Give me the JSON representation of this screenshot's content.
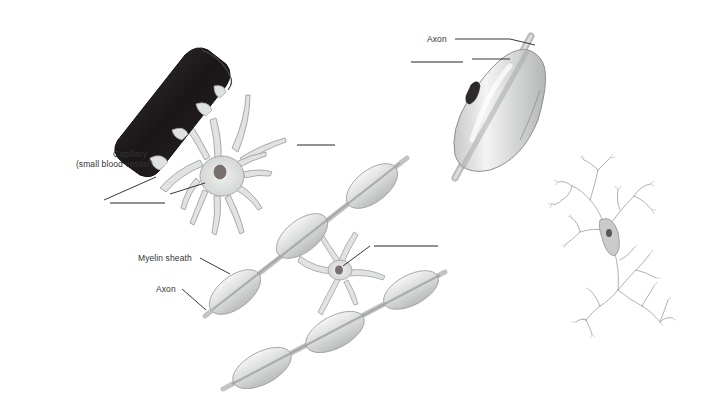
{
  "diagram": {
    "type": "anatomical-illustration",
    "background_color": "#ffffff",
    "figures": [
      {
        "id": "astrocyte",
        "description": "Star-shaped cell with processes attached to a dark capillary",
        "blank_label_count": 2
      },
      {
        "id": "schwann-cell",
        "description": "Cell wrapping around an axon forming myelin",
        "blank_label_count": 1
      },
      {
        "id": "oligodendrocyte",
        "description": "Cell with processes forming myelin sheaths on multiple axons",
        "blank_label_count": 2
      },
      {
        "id": "microglia",
        "description": "Small branching cell with spindle body",
        "blank_label_count": 0
      }
    ],
    "colors": {
      "capillary": "#1e1a1c",
      "cell_fill": "#e4e6e4",
      "cell_stroke": "#9a9e9c",
      "axon": "#c9cbca",
      "nucleus": "#6b5f5f",
      "line": "#222222"
    }
  },
  "labels": {
    "capillary_line1": "Capillary",
    "capillary_line2": "(small blood vessel)",
    "axon_top": "Axon",
    "myelin_sheath": "Myelin sheath",
    "axon_bottom": "Axon"
  },
  "blanks": [
    {
      "id": "blank-astrocyte-upper",
      "x1": 297,
      "y1": 145,
      "x2": 335,
      "y2": 145
    },
    {
      "id": "blank-astrocyte-body",
      "x1": 110,
      "y1": 203,
      "x2": 165,
      "y2": 203
    },
    {
      "id": "blank-schwann-cell",
      "x1": 411,
      "y1": 62,
      "x2": 463,
      "y2": 62
    },
    {
      "id": "blank-oligodendrocyte",
      "x1": 374,
      "y1": 246,
      "x2": 438,
      "y2": 246
    }
  ]
}
